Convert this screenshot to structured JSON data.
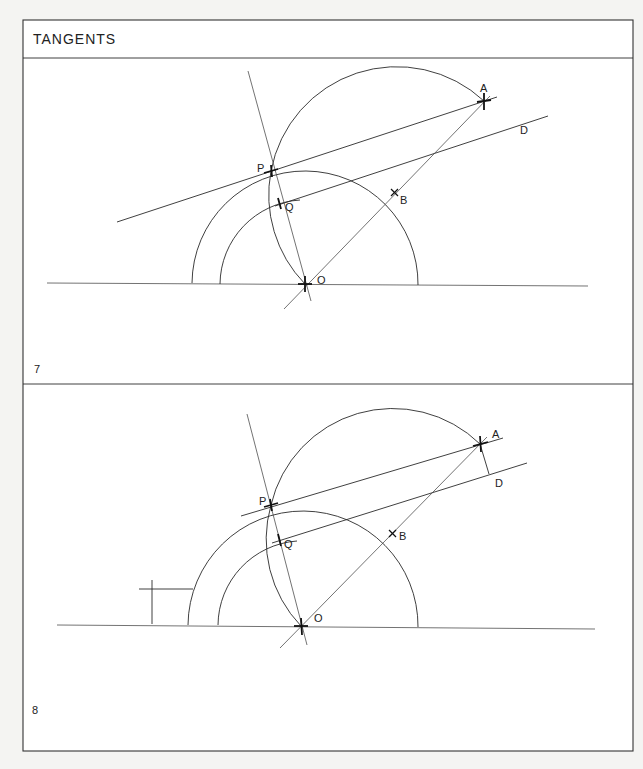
{
  "header": {
    "title": "TANGENTS"
  },
  "figures": [
    {
      "number": "7",
      "labels": {
        "A": "A",
        "B": "B",
        "D": "D",
        "P": "P",
        "Q": "Q",
        "O": "O"
      }
    },
    {
      "number": "8",
      "labels": {
        "A": "A",
        "B": "B",
        "D": "D",
        "P": "P",
        "Q": "Q",
        "O": "O"
      }
    }
  ]
}
